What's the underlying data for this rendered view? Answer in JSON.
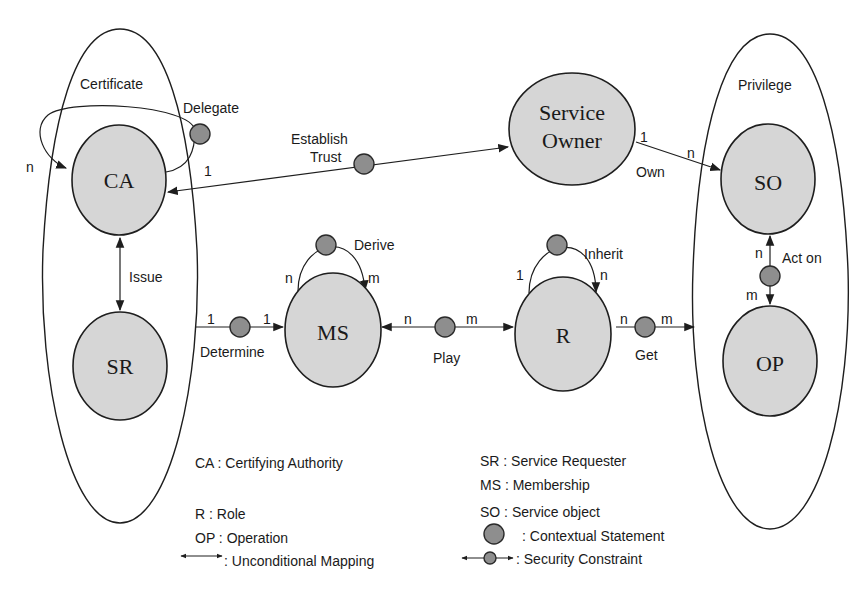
{
  "containers": {
    "certificate": "Certificate",
    "privilege": "Privilege"
  },
  "nodes": {
    "ca": "CA",
    "sr": "SR",
    "ms": "MS",
    "r": "R",
    "so": "SO",
    "op": "OP",
    "service_owner_line1": "Service",
    "service_owner_line2": "Owner"
  },
  "relations": {
    "delegate": {
      "label": "Delegate",
      "from_card": "1",
      "to_card": "n"
    },
    "establish_trust": {
      "line1": "Establish",
      "line2": "Trust"
    },
    "own": {
      "label": "Own",
      "from_card": "1",
      "to_card": "n"
    },
    "issue": {
      "label": "Issue"
    },
    "determine": {
      "label": "Determine",
      "from_card": "1",
      "to_card": "1"
    },
    "derive": {
      "label": "Derive",
      "from_card": "n",
      "to_card": "m"
    },
    "play": {
      "label": "Play",
      "from_card": "n",
      "to_card": "m"
    },
    "inherit": {
      "label": "Inherit",
      "from_card": "1",
      "to_card": "n"
    },
    "get": {
      "label": "Get",
      "from_card": "n",
      "to_card": "m"
    },
    "act_on": {
      "label": "Act on",
      "from_card": "n",
      "to_card": "m"
    }
  },
  "legend": {
    "ca": "CA : Certifying Authority",
    "r": "R : Role",
    "op": "OP : Operation",
    "unconditional": ": Unconditional Mapping",
    "sr": "SR : Service Requester",
    "ms": "MS : Membership",
    "so": "SO : Service object",
    "contextual": ": Contextual Statement",
    "security": ": Security Constraint"
  },
  "colors": {
    "node_fill": "#d6d6d6",
    "statement_fill": "#8e8e8e",
    "stroke": "#1e1e1e"
  }
}
